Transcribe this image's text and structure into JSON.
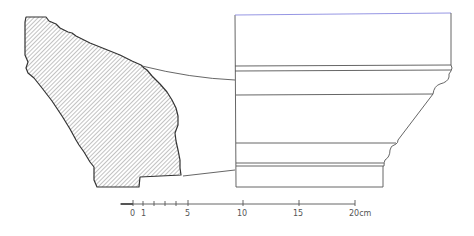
{
  "drawing": {
    "type": "architectural profile drawing",
    "fragment": {
      "label": "section-fragment",
      "fill": "hatched",
      "stroke": "#333333"
    },
    "profile": {
      "label": "reconstructed-molding-profile",
      "stroke": "#555555"
    }
  },
  "scale_bar": {
    "unit": "cm",
    "ticks": [
      {
        "value": 0,
        "label": "0",
        "x": 133
      },
      {
        "value": 1,
        "label": "1",
        "x": 143
      },
      {
        "value": 2,
        "label": "",
        "x": 154
      },
      {
        "value": 3,
        "label": "",
        "x": 165
      },
      {
        "value": 4,
        "label": "",
        "x": 176
      },
      {
        "value": 5,
        "label": "5",
        "x": 188
      },
      {
        "value": 10,
        "label": "10",
        "x": 243
      },
      {
        "value": 15,
        "label": "15",
        "x": 299
      },
      {
        "value": 20,
        "label": "20cm",
        "x": 355
      }
    ],
    "labels": {
      "l0": "0",
      "l1": "1",
      "l5": "5",
      "l10": "10",
      "l15": "15",
      "l20": "20cm"
    }
  },
  "colors": {
    "line": "#555555",
    "hatch": "#666666",
    "accent_top_edge": "#8a8ae0"
  }
}
